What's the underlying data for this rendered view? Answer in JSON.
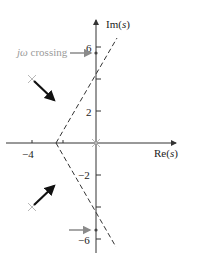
{
  "diagram": {
    "type": "root-locus",
    "axes": {
      "real_label_prefix": "Re(",
      "real_label_var": "s",
      "real_label_suffix": ")",
      "imag_label_prefix": "Im(",
      "imag_label_var": "s",
      "imag_label_suffix": ")",
      "real_ticks": [
        {
          "value": -4,
          "label": "−4"
        },
        {
          "value": -1,
          "label": ""
        }
      ],
      "imag_ticks": [
        {
          "value": 6,
          "label": "6"
        },
        {
          "value": 4,
          "label": ""
        },
        {
          "value": 2,
          "label": "2"
        },
        {
          "value": -2,
          "label": "−2"
        },
        {
          "value": -4,
          "label": ""
        },
        {
          "value": -6,
          "label": "−6"
        }
      ]
    },
    "poles": [
      {
        "re": 0,
        "im": 0
      },
      {
        "re": -4,
        "im": 4
      },
      {
        "re": -4,
        "im": -4
      }
    ],
    "asymptotes": {
      "centroid": -2.67,
      "angles_deg": [
        60,
        -60,
        180
      ]
    },
    "jw_crossing": {
      "label_prefix": "jω",
      "label_suffix": " crossing",
      "values": [
        5.66,
        -5.66
      ]
    },
    "colors": {
      "axis": "#333333",
      "pole_marker": "#b8b8b8",
      "arrow": "#111111",
      "annotation": "#9a9a9a",
      "dashed": "#333333"
    }
  }
}
